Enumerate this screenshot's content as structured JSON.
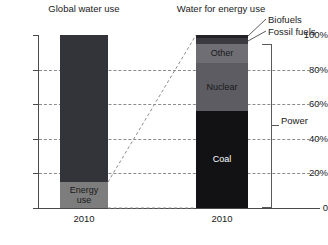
{
  "chart_data": {
    "type": "bar",
    "title": "",
    "xlabel": "",
    "ylabel": "",
    "ylim": [
      0,
      100
    ],
    "ytick_labels": [
      "0",
      "20%",
      "40%",
      "60%",
      "80%",
      "100%"
    ],
    "ytick_values": [
      0,
      20,
      40,
      60,
      80,
      100
    ],
    "grid": true,
    "gridlines_at": [
      20,
      40,
      60,
      80
    ],
    "legend_position": "annotations-right",
    "panels": [
      {
        "title": "Global water use",
        "category": "2010",
        "stacked_segments": [
          {
            "name": "Energy use",
            "label": "Energy\nuse",
            "value": 15,
            "from": 0,
            "to": 15,
            "color": "#7d7d7d",
            "text_color": "#1a1a1a"
          },
          {
            "name": "Other water use",
            "label": "",
            "value": 85,
            "from": 15,
            "to": 100,
            "color": "#33333a",
            "text_color": "#ffffff"
          }
        ]
      },
      {
        "title": "Water for energy use",
        "category": "2010",
        "stacked_segments": [
          {
            "name": "Coal",
            "label": "Coal",
            "value": 56,
            "from": 0,
            "to": 56,
            "color": "#121214",
            "text_color": "#ffffff"
          },
          {
            "name": "Nuclear",
            "label": "Nuclear",
            "value": 28,
            "from": 56,
            "to": 84,
            "color": "#5c5c62",
            "text_color": "#1a1a1a"
          },
          {
            "name": "Other",
            "label": "Other",
            "value": 11,
            "from": 84,
            "to": 95,
            "color": "#6e6e74",
            "text_color": "#1a1a1a"
          },
          {
            "name": "Fossil fuels",
            "label": "",
            "value": 3,
            "from": 95,
            "to": 98,
            "color": "#3a3a40",
            "text_color": "#ffffff"
          },
          {
            "name": "Biofuels",
            "label": "",
            "value": 2,
            "from": 98,
            "to": 100,
            "color": "#232327",
            "text_color": "#ffffff"
          }
        ]
      }
    ],
    "annotations": [
      {
        "name": "biofuels",
        "text": "Biofuels",
        "points_to": "Biofuels band (98%-100%) of right bar"
      },
      {
        "name": "fossil-fuels",
        "text": "Fossil fuels",
        "points_to": "Fossil fuels band (95%-98%) of right bar"
      },
      {
        "name": "power",
        "text": "Power",
        "points_to": "Bracket spanning 0%-95% of right bar"
      }
    ],
    "connectors": [
      {
        "name": "magnify-top",
        "from": "left bar 15%",
        "to": "right bar 100%"
      },
      {
        "name": "magnify-bottom",
        "from": "left bar 0%",
        "to": "right bar 0%"
      }
    ]
  },
  "axis": {
    "ticks": [
      {
        "label": "100%",
        "value": 100
      },
      {
        "label": "80%",
        "value": 80
      },
      {
        "label": "60%",
        "value": 60
      },
      {
        "label": "40%",
        "value": 40
      },
      {
        "label": "20%",
        "value": 20
      },
      {
        "label": "0",
        "value": 0
      }
    ]
  },
  "panel_left": {
    "title": "Global water use",
    "xlabel": "2010",
    "energy_use_label": "Energy\nuse"
  },
  "panel_right": {
    "title": "Water for energy use",
    "xlabel": "2010",
    "coal_label": "Coal",
    "nuclear_label": "Nuclear",
    "other_label": "Other"
  },
  "callouts": {
    "biofuels": "Biofuels",
    "fossil_fuels": "Fossil fuels",
    "power": "Power"
  },
  "colors": {
    "bar_dark": "#33333a",
    "energy_use": "#7d7d7d",
    "coal": "#121214",
    "nuclear": "#5c5c62",
    "other": "#6e6e74",
    "fossil_fuels": "#3a3a40",
    "biofuels": "#232327",
    "axis": "#4a4a4a",
    "grid": "#8c8c8c",
    "text": "#1a1a1a"
  }
}
